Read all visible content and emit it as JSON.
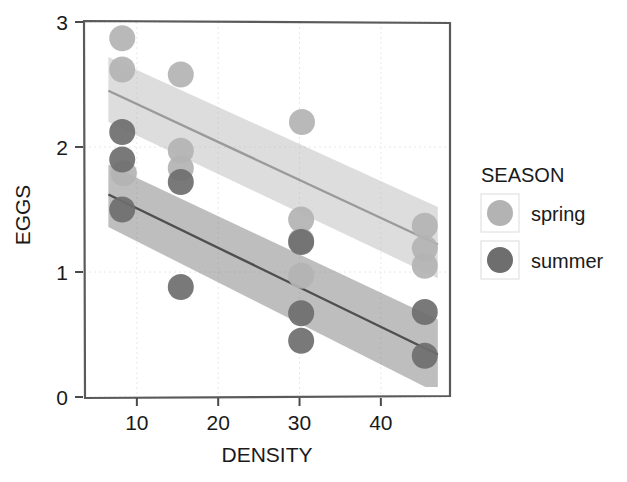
{
  "chart_data": {
    "type": "scatter",
    "title": "",
    "xlabel": "DENSITY",
    "ylabel": "EGGS",
    "xlim": [
      3.5,
      48.5
    ],
    "ylim": [
      0,
      3
    ],
    "xticks": [
      10,
      20,
      30,
      40
    ],
    "yticks": [
      0,
      1,
      2,
      3
    ],
    "xtick_labels": [
      "10",
      "20",
      "30",
      "40"
    ],
    "ytick_labels": [
      "0",
      "1",
      "2",
      "3"
    ],
    "grid": "light dotted gridlines at ticks",
    "legend": {
      "title": "SEASON",
      "position": "right",
      "entries": [
        {
          "label": "spring",
          "color": "#b3b3b3"
        },
        {
          "label": "summer",
          "color": "#6e6e6e"
        }
      ]
    },
    "series": [
      {
        "name": "spring",
        "color": "#b3b3b3",
        "marker": "filled-circle",
        "points": [
          {
            "x": 8.2,
            "y": 2.87
          },
          {
            "x": 8.2,
            "y": 2.62
          },
          {
            "x": 8.4,
            "y": 1.79
          },
          {
            "x": 15.4,
            "y": 2.58
          },
          {
            "x": 15.4,
            "y": 1.97
          },
          {
            "x": 15.4,
            "y": 1.83
          },
          {
            "x": 30.3,
            "y": 2.2
          },
          {
            "x": 30.2,
            "y": 1.42
          },
          {
            "x": 30.2,
            "y": 1.25
          },
          {
            "x": 30.2,
            "y": 0.97
          },
          {
            "x": 45.4,
            "y": 1.37
          },
          {
            "x": 45.4,
            "y": 1.19
          },
          {
            "x": 45.4,
            "y": 1.05
          }
        ],
        "fit_line": {
          "x": [
            6.5,
            47.0
          ],
          "y": [
            2.45,
            1.22
          ]
        },
        "confidence_band": {
          "x": [
            6.5,
            47.0
          ],
          "upper": [
            2.72,
            1.52
          ],
          "lower": [
            2.2,
            0.95
          ]
        }
      },
      {
        "name": "summer",
        "color": "#6e6e6e",
        "marker": "filled-circle",
        "points": [
          {
            "x": 8.2,
            "y": 2.12
          },
          {
            "x": 8.2,
            "y": 1.9
          },
          {
            "x": 8.2,
            "y": 1.5
          },
          {
            "x": 15.4,
            "y": 1.72
          },
          {
            "x": 15.4,
            "y": 0.88
          },
          {
            "x": 30.2,
            "y": 1.24
          },
          {
            "x": 30.2,
            "y": 0.67
          },
          {
            "x": 30.2,
            "y": 0.45
          },
          {
            "x": 45.4,
            "y": 0.68
          },
          {
            "x": 45.4,
            "y": 0.33
          }
        ],
        "fit_line": {
          "x": [
            6.5,
            47.0
          ],
          "y": [
            1.62,
            0.34
          ]
        },
        "confidence_band": {
          "x": [
            6.5,
            47.0
          ],
          "upper": [
            1.86,
            0.62
          ],
          "lower": [
            1.36,
            0.03
          ]
        }
      }
    ]
  }
}
